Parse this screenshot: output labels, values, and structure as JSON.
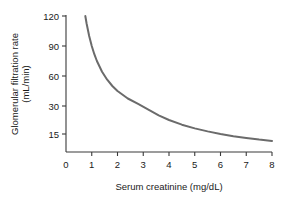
{
  "chart_data": {
    "type": "line",
    "title": "",
    "xlabel": "Serum creatinine (mg/dL)",
    "ylabel_line1": "Glomerular filtration rate",
    "ylabel_line2": "(mL/min)",
    "xlim": [
      0,
      8
    ],
    "x_ticks": [
      "0",
      "1",
      "2",
      "3",
      "4",
      "5",
      "6",
      "7",
      "8"
    ],
    "x_tick_values": [
      0,
      1,
      2,
      3,
      4,
      5,
      6,
      7,
      8
    ],
    "y_ticks": [
      "120",
      "90",
      "60",
      "30",
      "15"
    ],
    "y_tick_values": [
      120,
      90,
      60,
      30,
      15
    ],
    "grid": false,
    "legend": "none",
    "series": [
      {
        "name": "GFR vs serum creatinine",
        "color": "#6b6b6b",
        "line_width": 2,
        "x": [
          0.75,
          0.8,
          0.9,
          1.0,
          1.1,
          1.2,
          1.4,
          1.6,
          1.8,
          2.0,
          2.4,
          2.8,
          3.2,
          3.6,
          4.0,
          4.5,
          5.0,
          5.5,
          6.0,
          6.5,
          7.0,
          7.5,
          8.0
        ],
        "y": [
          120,
          112.5,
          100,
          90,
          81.8,
          75,
          64.3,
          56.3,
          50,
          45,
          37.5,
          32.1,
          28.1,
          25,
          22.5,
          20,
          18,
          16.4,
          15,
          13.8,
          12.9,
          12,
          11.3
        ]
      }
    ],
    "annotations": []
  },
  "style": {
    "axis_color": "#3a3a3a",
    "curve_color": "#6b6b6b",
    "background": "#ffffff",
    "text_color": "#1a1a1a"
  }
}
